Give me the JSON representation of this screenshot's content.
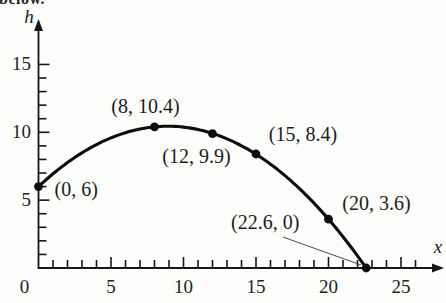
{
  "page": {
    "partial_sentence": "below."
  },
  "chart_data": {
    "type": "line",
    "title": "",
    "xlabel": "x",
    "ylabel": "h",
    "xlim": [
      0,
      27
    ],
    "ylim": [
      0,
      16.5
    ],
    "grid": false,
    "x_ticks_major": [
      0,
      5,
      10,
      15,
      20,
      25
    ],
    "x_tick_labels": [
      "0",
      "5",
      "10",
      "15",
      "20",
      "25"
    ],
    "y_ticks_major": [
      5,
      10,
      15
    ],
    "y_tick_labels": [
      "5",
      "10",
      "15"
    ],
    "minor_tick_step": 1,
    "x_minor_tick_max": 26,
    "y_minor_tick_max": 15,
    "ink_color": "#161616",
    "points": [
      {
        "x": 0,
        "h": 6,
        "label": "(0, 6)"
      },
      {
        "x": 8,
        "h": 10.4,
        "label": "(8, 10.4)"
      },
      {
        "x": 12,
        "h": 9.9,
        "label": "(12, 9.9)"
      },
      {
        "x": 15,
        "h": 8.4,
        "label": "(15, 8.4)"
      },
      {
        "x": 20,
        "h": 3.6,
        "label": "(20, 3.6)"
      },
      {
        "x": 22.6,
        "h": 0,
        "label": "(22.6, 0)"
      }
    ],
    "annotation_leader": {
      "from_label": "(22.6, 0)",
      "to_point": [
        22.6,
        0
      ]
    }
  }
}
